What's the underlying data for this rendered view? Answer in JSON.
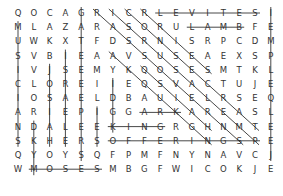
{
  "puzzle": {
    "type": "word-search",
    "cols": 17,
    "rows": 13,
    "cell_w": 15.8,
    "cell_h": 14.2,
    "line_color": "#333333",
    "text_color": "#333333",
    "grid": [
      [
        "Q",
        "O",
        "C",
        "A",
        "G",
        "R",
        "I",
        "C",
        "R",
        "L",
        "E",
        "V",
        "I",
        "T",
        "E",
        "S",
        "I",
        "O"
      ],
      [
        "M",
        "L",
        "A",
        "Z",
        "A",
        "R",
        "A",
        "S",
        "O",
        "R",
        "U",
        "L",
        "A",
        "M",
        "B",
        "F",
        "E",
        "N"
      ],
      [
        "U",
        "W",
        "K",
        "X",
        "T",
        "F",
        "D",
        "S",
        "R",
        "N",
        "I",
        "S",
        "R",
        "P",
        "C",
        "D",
        "M",
        "E"
      ],
      [
        "S",
        "V",
        "B",
        "I",
        "E",
        "A",
        "A",
        "V",
        "S",
        "U",
        "S",
        "E",
        "A",
        "E",
        "X",
        "S",
        "P",
        "M"
      ],
      [
        "I",
        "V",
        "J",
        "S",
        "E",
        "M",
        "Y",
        "K",
        "Q",
        "O",
        "S",
        "E",
        "S",
        "M",
        "T",
        "K",
        "L",
        "S"
      ],
      [
        "C",
        "L",
        "O",
        "R",
        "E",
        "I",
        "I",
        "E",
        "Q",
        "S",
        "V",
        "A",
        "C",
        "T",
        "U",
        "J",
        "E",
        "O"
      ],
      [
        "I",
        "O",
        "S",
        "A",
        "E",
        "L",
        "D",
        "B",
        "A",
        "U",
        "I",
        "E",
        "L",
        "R",
        "S",
        "E",
        "Q",
        "L"
      ],
      [
        "A",
        "R",
        "I",
        "E",
        "P",
        "I",
        "G",
        "G",
        "A",
        "R",
        "K",
        "A",
        "R",
        "E",
        "A",
        "S",
        "L",
        "O"
      ],
      [
        "N",
        "D",
        "A",
        "L",
        "E",
        "E",
        "K",
        "I",
        "N",
        "G",
        "R",
        "G",
        "H",
        "N",
        "M",
        "T",
        "E",
        "M"
      ],
      [
        "S",
        "K",
        "H",
        "E",
        "R",
        "S",
        "O",
        "F",
        "F",
        "E",
        "R",
        "I",
        "N",
        "G",
        "S",
        "P",
        "E",
        "O"
      ],
      [
        "Q",
        "Y",
        "O",
        "Y",
        "S",
        "Q",
        "F",
        "P",
        "M",
        "F",
        "N",
        "Y",
        "N",
        "A",
        "V",
        "C",
        "J",
        "N"
      ],
      [
        "W",
        "M",
        "O",
        "S",
        "E",
        "S",
        "M",
        "B",
        "G",
        "F",
        "W",
        "I",
        "C",
        "O",
        "K",
        "J",
        "E",
        "J"
      ]
    ],
    "found_words": [
      "LEVITES",
      "LAMB",
      "KING",
      "OFFERINGS",
      "MOSES",
      "ARK"
    ],
    "lines": [
      {
        "dir": "horizontal",
        "row": 0,
        "from": 9,
        "to": 15
      },
      {
        "dir": "horizontal",
        "row": 1,
        "from": 11,
        "to": 14
      },
      {
        "dir": "horizontal",
        "row": 7,
        "from": 8,
        "to": 10
      },
      {
        "dir": "horizontal",
        "row": 8,
        "from": 6,
        "to": 9
      },
      {
        "dir": "horizontal",
        "row": 9,
        "from": 6,
        "to": 15
      },
      {
        "dir": "horizontal",
        "row": 11,
        "from": 1,
        "to": 5
      },
      {
        "dir": "vertical",
        "col": 0,
        "from": 1,
        "to": 9
      },
      {
        "dir": "vertical",
        "col": 1,
        "from": 8,
        "to": 11
      },
      {
        "dir": "vertical",
        "col": 2,
        "from": 4,
        "to": 9
      },
      {
        "dir": "vertical",
        "col": 3,
        "from": 3,
        "to": 9
      },
      {
        "dir": "vertical",
        "col": 4,
        "from": 0,
        "to": 10
      },
      {
        "dir": "vertical",
        "col": 5,
        "from": 7,
        "to": 9
      },
      {
        "dir": "vertical",
        "col": 6,
        "from": 5,
        "to": 8
      },
      {
        "dir": "vertical",
        "col": 16,
        "from": 0,
        "to": 10
      },
      {
        "dir": "diagonal",
        "r": 0,
        "c": 5,
        "len": 10
      },
      {
        "dir": "diagonal",
        "r": 0,
        "c": 6,
        "len": 10
      },
      {
        "dir": "diagonal",
        "r": 0,
        "c": 7,
        "len": 9
      },
      {
        "dir": "diagonal",
        "r": 0,
        "c": 8,
        "len": 5
      },
      {
        "dir": "diagonal",
        "r": 3,
        "c": 6,
        "len": 7
      },
      {
        "dir": "diagonal",
        "r": 4,
        "c": 8,
        "len": 5
      }
    ]
  }
}
